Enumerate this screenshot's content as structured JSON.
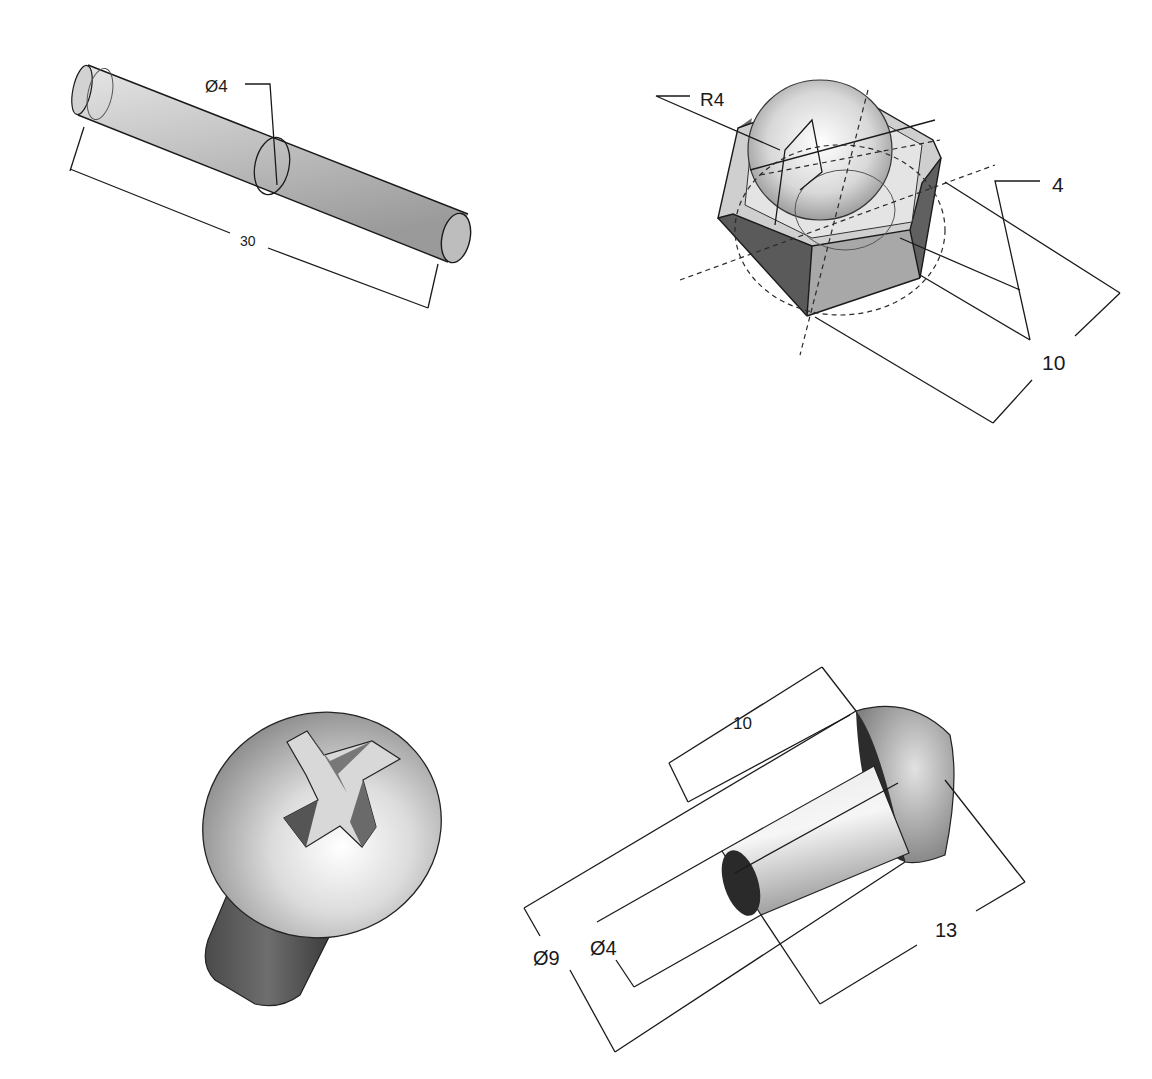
{
  "drawing": {
    "background": "#ffffff",
    "line_color": "#1a1a1a",
    "parts": [
      {
        "id": "pin",
        "name": "Cylindrical pin",
        "dimensions": {
          "diameter": "Ø4",
          "length": "30"
        }
      },
      {
        "id": "cap-nut",
        "name": "Hex dome cap nut",
        "dimensions": {
          "radius": "R4",
          "thickness": "4",
          "width": "10"
        }
      },
      {
        "id": "phillips-screw",
        "name": "Pan-head Phillips screw (shaded view)",
        "dimensions": {}
      },
      {
        "id": "round-head-rivet",
        "name": "Round-head rivet",
        "dimensions": {
          "shank_length": "10",
          "head_diameter": "Ø9",
          "shank_diameter": "Ø4",
          "total_length": "13"
        }
      }
    ]
  }
}
